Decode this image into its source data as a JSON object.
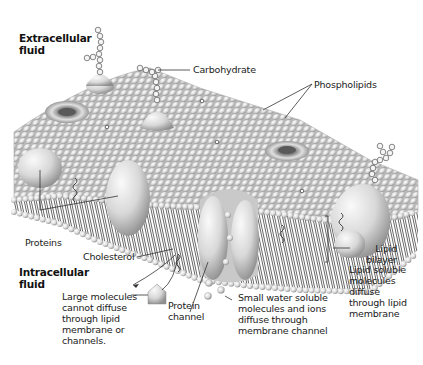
{
  "diagram": {
    "regions": {
      "extracellular": "Extracellular\nfluid",
      "intracellular": "Intracellular\nfluid"
    },
    "labels": {
      "carbohydrate": "Carbohydrate",
      "phospholipids": "Phospholipids",
      "proteins": "Proteins",
      "cholesterol": "Cholesterol",
      "lipid_bilayer": "Lipid\nbilayer",
      "lipid_soluble": "Lipid soluble\nmolecules\ndiffuse\nthrough lipid\nmembrane",
      "large_molecules": "Large molecules\ncannot diffuse\nthrough lipid\nmembrane or\nchannels.",
      "protein_channel": "Protein\nchannel",
      "small_water": "Small water soluble\nmolecules and ions\ndiffuse through\nmembrane channel"
    },
    "colors": {
      "background": "#ffffff",
      "membrane": "#d9d9d9",
      "bead": "#e6e6e6",
      "bead_shadow": "#a8a8a8",
      "protein": "#dcdcdc",
      "text": "#222222"
    }
  }
}
